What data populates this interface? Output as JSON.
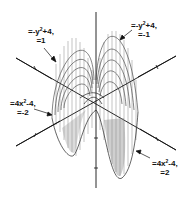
{
  "figure": {
    "colors": {
      "ink": "#111111",
      "background": "#ffffff",
      "mesh": "#444444"
    },
    "labels": [
      {
        "id": "top-left",
        "line1_pre": "=-y",
        "line1_sup": "2",
        "line1_post": "+4,",
        "line2": "=1"
      },
      {
        "id": "top-right",
        "line1_pre": "=-y",
        "line1_sup": "2",
        "line1_post": "+4,",
        "line2": "=-1"
      },
      {
        "id": "mid-left",
        "line1_pre": "=4x",
        "line1_sup": "2",
        "line1_post": "-4,",
        "line2": "=-2"
      },
      {
        "id": "bottom-right",
        "line1_pre": "=4x",
        "line1_sup": "2",
        "line1_post": "-4,",
        "line2": "=2"
      }
    ]
  }
}
